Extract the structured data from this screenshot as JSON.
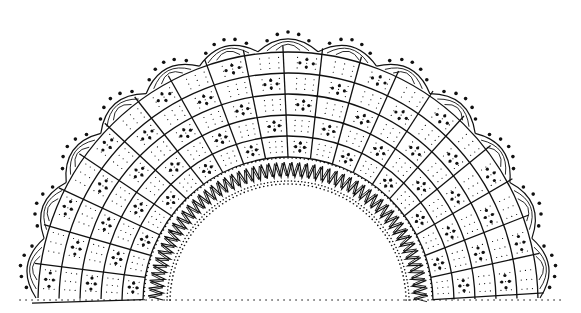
{
  "image": {
    "type": "line-drawing",
    "subject": "semicircular lace doily pattern",
    "colors": {
      "ink": "#111111",
      "background": "#ffffff"
    },
    "geometry": {
      "center": [
        288,
        302
      ],
      "inner_dotted_radius": 118,
      "zigzag_band": [
        125,
        140
      ],
      "grid_band": [
        145,
        250
      ],
      "grid_rings": 5,
      "grid_spokes": 20,
      "scallop_count": 13,
      "scallop_radius_outer": 262
    }
  }
}
